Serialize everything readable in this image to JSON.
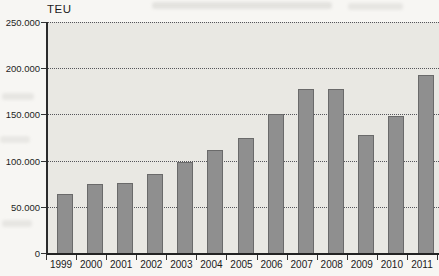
{
  "chart_data": {
    "type": "bar",
    "title": "",
    "ylabel": "TEU",
    "xlabel": "",
    "categories": [
      "1999",
      "2000",
      "2001",
      "2002",
      "2003",
      "2004",
      "2005",
      "2006",
      "2007",
      "2008",
      "2009",
      "2010",
      "2011"
    ],
    "values": [
      64000,
      75000,
      76000,
      86000,
      98000,
      111000,
      125000,
      150000,
      178000,
      178000,
      128000,
      148000,
      193000
    ],
    "ylim": [
      0,
      250000
    ],
    "yticks": [
      0,
      50000,
      100000,
      150000,
      200000,
      250000
    ],
    "ytick_labels": [
      "0",
      "50.000",
      "100.000",
      "150.000",
      "200.000",
      "250.000"
    ],
    "legend": "none",
    "grid": "horizontal-dotted",
    "bar_color": "#8f8f8f",
    "plot_bg_color": "#e9e8e3",
    "axis_color": "#2b2b2b"
  }
}
